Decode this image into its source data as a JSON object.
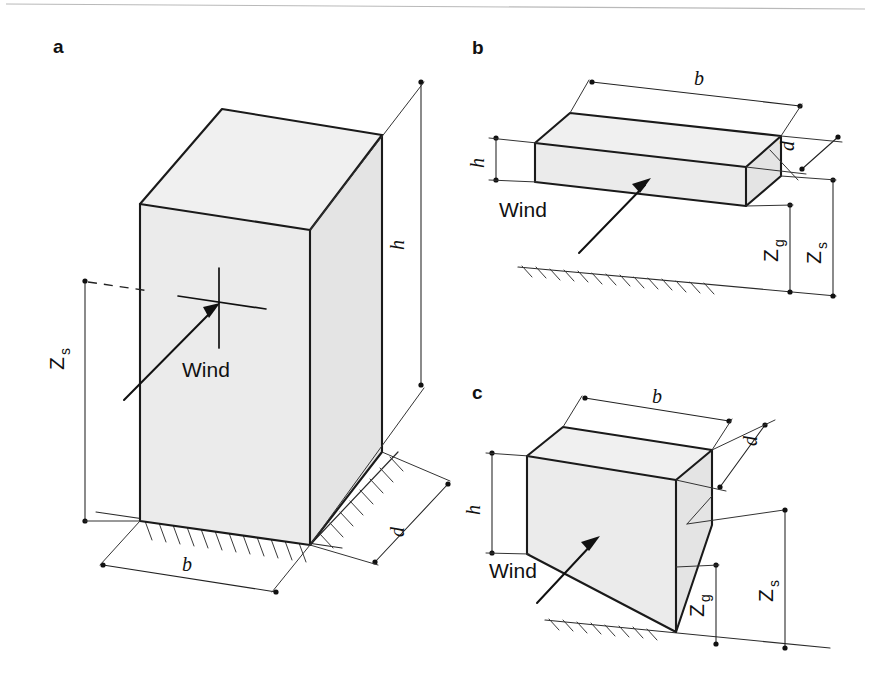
{
  "figure": {
    "kind": "engineering-diagram",
    "background_color": "#ffffff",
    "line_color": "#1a1a1a",
    "face_fill": "#ebebeb"
  },
  "panels": [
    {
      "id": "a",
      "letter": "a",
      "shape": "tall rectangular block resting on ground",
      "wind_label": "Wind",
      "dimensions": [
        {
          "name": "height",
          "symbol": "h",
          "sub": ""
        },
        {
          "name": "breadth",
          "symbol": "b",
          "sub": ""
        },
        {
          "name": "depth",
          "symbol": "d",
          "sub": ""
        },
        {
          "name": "reference-height-structure",
          "symbol": "Z",
          "sub": "s"
        }
      ]
    },
    {
      "id": "b",
      "letter": "b",
      "shape": "wide flat slab elevated above ground",
      "wind_label": "Wind",
      "dimensions": [
        {
          "name": "height",
          "symbol": "h",
          "sub": ""
        },
        {
          "name": "breadth",
          "symbol": "b",
          "sub": ""
        },
        {
          "name": "depth",
          "symbol": "d",
          "sub": ""
        },
        {
          "name": "gap-height",
          "symbol": "Z",
          "sub": "g"
        },
        {
          "name": "reference-height-structure",
          "symbol": "Z",
          "sub": "s"
        }
      ]
    },
    {
      "id": "c",
      "letter": "c",
      "shape": "compact rectangular block elevated above ground",
      "wind_label": "Wind",
      "dimensions": [
        {
          "name": "height",
          "symbol": "h",
          "sub": ""
        },
        {
          "name": "breadth",
          "symbol": "b",
          "sub": ""
        },
        {
          "name": "depth",
          "symbol": "d",
          "sub": ""
        },
        {
          "name": "gap-height",
          "symbol": "Z",
          "sub": "g"
        },
        {
          "name": "reference-height-structure",
          "symbol": "Z",
          "sub": "s"
        }
      ]
    }
  ],
  "labels": {
    "panel_a": "a",
    "panel_b": "b",
    "panel_c": "c",
    "wind": "Wind",
    "h": "h",
    "b": "b",
    "d": "d",
    "Z": "Z",
    "sub_s": "s",
    "sub_g": "g"
  }
}
